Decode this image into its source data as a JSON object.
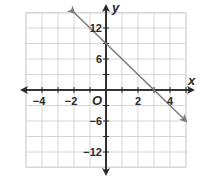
{
  "chart_data": {
    "type": "line",
    "title": "",
    "xlabel": "x",
    "ylabel": "y",
    "origin_label": "O",
    "xlim": [
      -5,
      5
    ],
    "ylim": [
      -15,
      18
    ],
    "x_grid_step": 1,
    "y_grid_step": 3,
    "grid": true,
    "x_tick_labels": [
      "−4",
      "−2",
      "2",
      "4"
    ],
    "x_tick_values": [
      -4,
      -2,
      2,
      4
    ],
    "y_tick_labels": [
      "12",
      "6",
      "−6",
      "−12"
    ],
    "y_tick_values": [
      12,
      6,
      -6,
      -12
    ],
    "series": [
      {
        "name": "line",
        "equation": "y = -3x + 9",
        "x": [
          -2,
          0,
          3,
          5
        ],
        "y": [
          15,
          9,
          0,
          -6
        ],
        "arrows_both_ends": true
      }
    ],
    "colors": {
      "line": "#7a7a7a",
      "axes": "#2a2a2a",
      "grid": "#d6d6d6"
    }
  }
}
